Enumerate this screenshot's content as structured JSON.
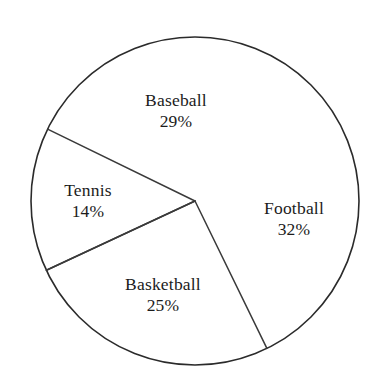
{
  "chart_data": {
    "type": "pie",
    "title": "",
    "subtitle": "",
    "xlabel": "",
    "ylabel": "",
    "legend": "none",
    "grid": false,
    "value_unit": "%",
    "categories": [
      "Baseball",
      "Football",
      "Basketball",
      "Tennis"
    ],
    "values": [
      29,
      32,
      25,
      14
    ],
    "slices": [
      {
        "name": "Baseball",
        "value": 29,
        "value_label": "29%",
        "start_angle_deg": -51,
        "end_angle_deg": -205,
        "fill": "#ffffff",
        "stroke": "#2b2b2b"
      },
      {
        "name": "Football",
        "value": 32,
        "value_label": "32%",
        "start_angle_deg": -51,
        "end_angle_deg": 64,
        "fill": "#ffffff",
        "stroke": "#2b2b2b"
      },
      {
        "name": "Basketball",
        "value": 25,
        "value_label": "25%",
        "start_angle_deg": 64,
        "end_angle_deg": 155,
        "fill": "#ffffff",
        "stroke": "#2b2b2b"
      },
      {
        "name": "Tennis",
        "value": 14,
        "value_label": "14%",
        "start_angle_deg": 155,
        "end_angle_deg": 206,
        "fill": "#ffffff",
        "stroke": "#2b2b2b"
      }
    ],
    "geometry": {
      "center_x": 195,
      "center_y": 201,
      "radius": 164
    },
    "colors": {
      "background": "#ffffff",
      "outline": "#2b2b2b",
      "divider": "#3a3a3a",
      "text": "#1c1c1c"
    }
  },
  "labels": {
    "baseball": {
      "name": "Baseball",
      "value": "29%"
    },
    "football": {
      "name": "Football",
      "value": "32%"
    },
    "basketball": {
      "name": "Basketball",
      "value": "25%"
    },
    "tennis": {
      "name": "Tennis",
      "value": "14%"
    }
  }
}
